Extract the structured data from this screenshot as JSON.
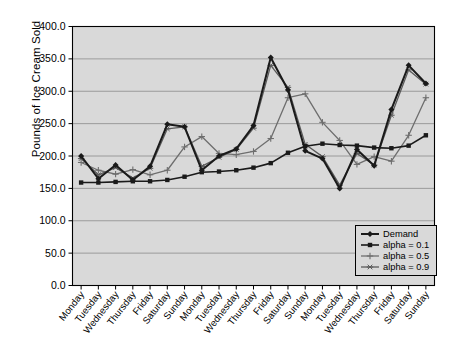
{
  "chart_data": {
    "type": "line",
    "title": "",
    "xlabel": "",
    "ylabel": "Pounds of Ice Cream Sold",
    "ylim": [
      0,
      400
    ],
    "ytick_labels": [
      "0.0",
      "50.0",
      "100.0",
      "150.0",
      "200.0",
      "250.0",
      "300.0",
      "350.0",
      "400.0"
    ],
    "ytick_values": [
      0,
      50,
      100,
      150,
      200,
      250,
      300,
      350,
      400
    ],
    "grid": true,
    "legend_position": "bottom-right",
    "categories": [
      "Monday",
      "Tuesday",
      "Wednesday",
      "Thursday",
      "Friday",
      "Saturday",
      "Sunday",
      "Monday",
      "Tuesday",
      "Wednesday",
      "Thursday",
      "Friday",
      "Saturday",
      "Sunday",
      "Monday",
      "Tuesday",
      "Wednesday",
      "Thursday",
      "Friday",
      "Saturday",
      "Sunday"
    ],
    "series": [
      {
        "name": "Demand",
        "color": "#1a1a1a",
        "marker": "diamond",
        "width": 2.0,
        "values": [
          200,
          165,
          186,
          163,
          184,
          249,
          245,
          178,
          200,
          211,
          247,
          352,
          302,
          208,
          196,
          150,
          210,
          185,
          272,
          340,
          312
        ]
      },
      {
        "name": "alpha = 0.1",
        "color": "#1a1a1a",
        "marker": "square",
        "width": 1.6,
        "values": [
          159,
          159,
          160,
          161,
          161,
          163,
          168,
          175,
          176,
          178,
          182,
          189,
          205,
          215,
          219,
          217,
          216,
          213,
          212,
          216,
          232
        ]
      },
      {
        "name": "alpha = 0.5",
        "color": "#6e6e6e",
        "marker": "plus",
        "width": 1.3,
        "values": [
          190,
          178,
          172,
          179,
          171,
          178,
          214,
          230,
          204,
          202,
          207,
          227,
          290,
          296,
          252,
          224,
          187,
          199,
          192,
          232,
          290
        ]
      },
      {
        "name": "alpha = 0.9",
        "color": "#5a5a5a",
        "marker": "star",
        "width": 1.3,
        "values": [
          196,
          171,
          182,
          166,
          181,
          242,
          245,
          184,
          198,
          210,
          243,
          340,
          306,
          218,
          199,
          155,
          204,
          186,
          263,
          333,
          311
        ]
      }
    ]
  },
  "legend": {
    "items": [
      {
        "label": "Demand"
      },
      {
        "label": "alpha = 0.1"
      },
      {
        "label": "alpha = 0.5"
      },
      {
        "label": "alpha = 0.9"
      }
    ]
  },
  "style": {
    "plot_background": "#d9d9d9",
    "grid_color": "#8c8c8c",
    "axis_color": "#000000"
  }
}
